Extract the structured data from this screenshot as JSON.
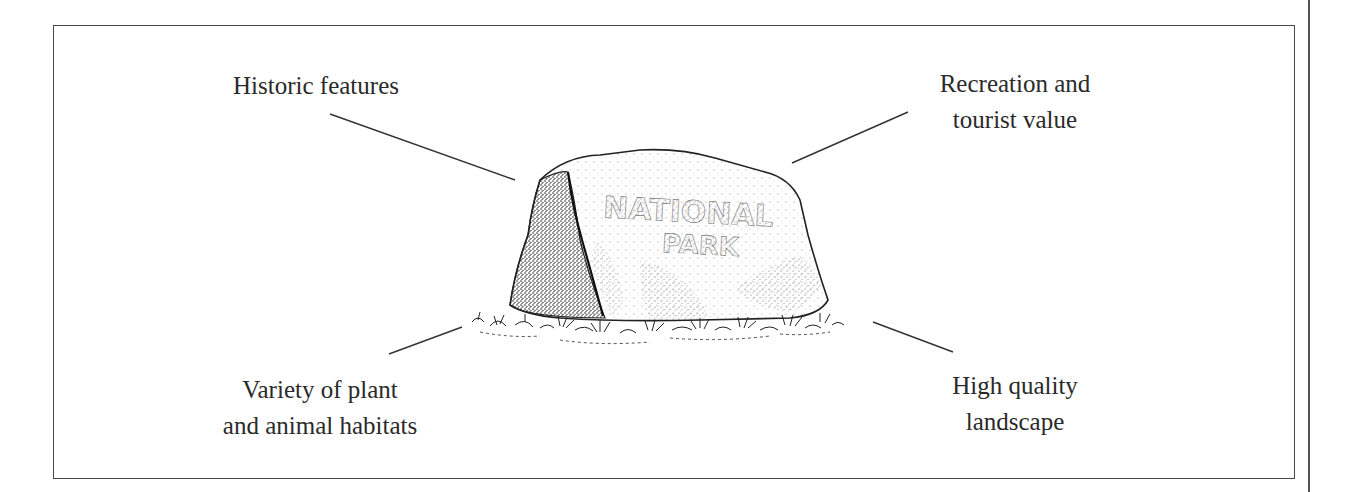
{
  "diagram": {
    "center": {
      "subject": "National Park boulder sign",
      "sign_text": [
        "NATIONAL",
        "PARK"
      ]
    },
    "labels": {
      "top_left": {
        "lines": [
          "Historic features"
        ]
      },
      "top_right": {
        "lines": [
          "Recreation and",
          "tourist value"
        ]
      },
      "bottom_left": {
        "lines": [
          "Variety of plant",
          "and animal habitats"
        ]
      },
      "bottom_right": {
        "lines": [
          "High quality",
          "landscape"
        ]
      }
    }
  },
  "colors": {
    "ink": "#2a2a2a",
    "frame": "#4a4a4a",
    "background": "#ffffff"
  }
}
